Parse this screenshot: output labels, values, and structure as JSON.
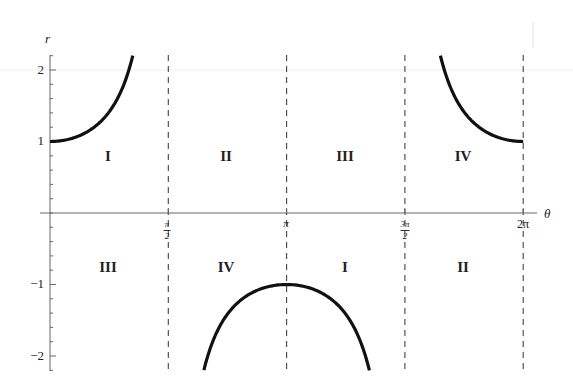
{
  "chart_data": {
    "type": "line",
    "title": "",
    "function": "r = sec(theta)",
    "xlabel": "θ",
    "ylabel": "r",
    "xlim": [
      0,
      6.2832
    ],
    "ylim": [
      -2.2,
      2.2
    ],
    "grid": false,
    "legend": null,
    "x_ticks": [
      {
        "value": 1.5708,
        "label": "π/2",
        "num": "π",
        "den": "2"
      },
      {
        "value": 3.1416,
        "label": "π",
        "num": "π",
        "den": ""
      },
      {
        "value": 4.7124,
        "label": "3π/2",
        "num": "3π",
        "den": "2"
      },
      {
        "value": 6.2832,
        "label": "2π",
        "num": "2π",
        "den": ""
      }
    ],
    "y_ticks": [
      {
        "value": 2,
        "label": "2"
      },
      {
        "value": 1,
        "label": "1"
      },
      {
        "value": -1,
        "label": "−1"
      },
      {
        "value": -2,
        "label": "−2"
      }
    ],
    "asymptotes": [
      1.5708,
      3.1416,
      4.7124,
      6.2832
    ],
    "series": [
      {
        "name": "r = sec θ (0 ≤ θ < π/2)",
        "x": [
          0,
          0.3,
          0.6,
          0.8,
          0.95,
          1.05,
          1.099
        ],
        "y": [
          1.0,
          1.047,
          1.212,
          1.435,
          1.718,
          2.009,
          2.2
        ]
      },
      {
        "name": "r = sec θ (π/2 < θ < 3π/2)",
        "x": [
          2.043,
          2.3,
          2.6,
          2.9,
          3.1416,
          3.4,
          3.7,
          4.0,
          4.241
        ],
        "y": [
          -2.2,
          -1.5,
          -1.166,
          -1.03,
          -1.0,
          -1.034,
          -1.182,
          -1.53,
          -2.2
        ]
      },
      {
        "name": "r = sec θ (3π/2 < θ ≤ 2π)",
        "x": [
          5.184,
          5.3,
          5.5,
          5.8,
          6.0,
          6.2832
        ],
        "y": [
          2.2,
          1.802,
          1.409,
          1.129,
          1.041,
          1.0
        ]
      }
    ],
    "annotations": {
      "upper": [
        {
          "x": 0.785,
          "text": "I"
        },
        {
          "x": 2.356,
          "text": "II"
        },
        {
          "x": 3.927,
          "text": "III"
        },
        {
          "x": 5.498,
          "text": "IV"
        }
      ],
      "lower": [
        {
          "x": 0.785,
          "text": "III"
        },
        {
          "x": 2.356,
          "text": "IV"
        },
        {
          "x": 3.927,
          "text": "I"
        },
        {
          "x": 5.498,
          "text": "II"
        }
      ]
    }
  },
  "labels": {
    "r_axis": "r",
    "theta_axis": "θ",
    "y2": "2",
    "y1": "1",
    "ym1": "−1",
    "ym2": "−2",
    "x_pi_half_num": "π",
    "x_pi_half_den": "2",
    "x_pi": "π",
    "x_3pi_half_num": "3π",
    "x_3pi_half_den": "2",
    "x_2pi": "2π",
    "q_upper_1": "I",
    "q_upper_2": "II",
    "q_upper_3": "III",
    "q_upper_4": "IV",
    "q_lower_1": "III",
    "q_lower_2": "IV",
    "q_lower_3": "I",
    "q_lower_4": "II"
  },
  "colors": {
    "curve": "#111111",
    "axis": "#666666",
    "asymptote": "#444444",
    "text": "#222222"
  }
}
